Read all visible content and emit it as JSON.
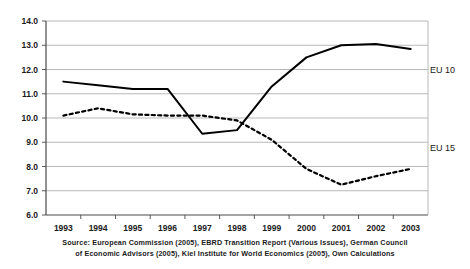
{
  "chart_data": {
    "type": "line",
    "title": "",
    "subtitle": "",
    "xlabel": "",
    "ylabel": "",
    "categories": [
      "1993",
      "1994",
      "1995",
      "1996",
      "1997",
      "1998",
      "1999",
      "2000",
      "2001",
      "2002",
      "2003"
    ],
    "ylim": [
      6.0,
      14.0
    ],
    "ytick_labels": [
      "6.0",
      "7.0",
      "8.0",
      "9.0",
      "10.0",
      "11.0",
      "12.0",
      "13.0",
      "14.0"
    ],
    "ytick_values": [
      6.0,
      7.0,
      8.0,
      9.0,
      10.0,
      11.0,
      12.0,
      13.0,
      14.0
    ],
    "grid": true,
    "grid_axis": "y",
    "legend": "inline-labels",
    "legend_position": "right-of-series",
    "series": [
      {
        "name": "EU 10",
        "style": "solid",
        "color": "#000000",
        "label": "EU 10",
        "label_x": "2003",
        "label_y": 12.0,
        "values": [
          11.5,
          11.35,
          11.2,
          11.2,
          9.35,
          9.5,
          11.3,
          12.5,
          13.0,
          13.05,
          12.85
        ]
      },
      {
        "name": "EU 15",
        "style": "dashed",
        "color": "#000000",
        "label": "EU 15",
        "label_x": "2003",
        "label_y": 8.75,
        "values": [
          10.1,
          10.4,
          10.15,
          10.1,
          10.1,
          9.9,
          9.1,
          7.9,
          7.25,
          7.6,
          7.9
        ]
      }
    ]
  },
  "source": {
    "line1": "Source: European Commission (2005), EBRD Transition Report (Various Issues), German Council",
    "line2": "of Economic Advisors (2005), Kiel Institute for World Economics (2005), Own Calculations"
  }
}
